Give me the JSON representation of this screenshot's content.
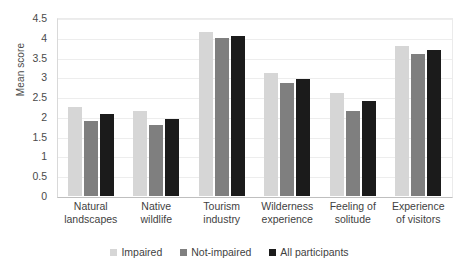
{
  "chart_data": {
    "type": "bar",
    "title": "",
    "xlabel": "",
    "ylabel": "Mean score",
    "ylim": [
      0,
      4.5
    ],
    "ytick_labels": [
      "4.5",
      "4",
      "3.5",
      "3",
      "2.5",
      "2",
      "1.5",
      "1",
      "0.5",
      "0"
    ],
    "ytick_values": [
      4.5,
      4,
      3.5,
      3,
      2.5,
      2,
      1.5,
      1,
      0.5,
      0
    ],
    "grid": true,
    "legend_position": "bottom",
    "categories": [
      "Natural landscapes",
      "Native wildlife",
      "Tourism industry",
      "Wilderness experience",
      "Feeling of solitude",
      "Experience of visitors"
    ],
    "series": [
      {
        "name": "Impaired",
        "color": "#d6d6d6",
        "values": [
          2.25,
          2.15,
          4.15,
          3.1,
          2.6,
          3.8
        ]
      },
      {
        "name": "Not-impaired",
        "color": "#7f7f7f",
        "values": [
          1.9,
          1.8,
          4.0,
          2.85,
          2.15,
          3.6
        ]
      },
      {
        "name": "All participants",
        "color": "#1b1b1b",
        "values": [
          2.08,
          1.95,
          4.05,
          2.95,
          2.4,
          3.7
        ]
      }
    ]
  }
}
